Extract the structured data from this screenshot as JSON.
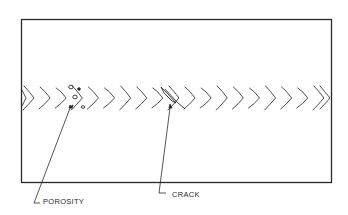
{
  "diagram": {
    "type": "weld-defect-illustration",
    "plate": {
      "x": 21,
      "y": 19,
      "width": 310,
      "height": 164
    },
    "weld_bead": {
      "y_center": 98,
      "chevron_count": 19,
      "direction": "right"
    },
    "colors": {
      "line": "#2a2a2a",
      "background": "#ffffff"
    }
  },
  "labels": {
    "porosity": "POROSITY",
    "crack": "CRACK"
  },
  "callouts": [
    {
      "name": "porosity",
      "target": [
        70,
        107
      ],
      "elbow": [
        34,
        205
      ],
      "text_x": 42,
      "text_y": 200
    },
    {
      "name": "crack",
      "target": [
        170,
        107
      ],
      "elbow": [
        159,
        193
      ],
      "text_x": 172,
      "text_y": 193
    }
  ]
}
